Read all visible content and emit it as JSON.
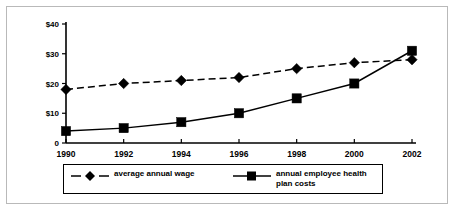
{
  "chart_data": {
    "type": "line",
    "title": "",
    "subtitle": "",
    "xlabel": "",
    "ylabel": "",
    "categories": [
      "1990",
      "1992",
      "1994",
      "1996",
      "1998",
      "2000",
      "2002"
    ],
    "x": [
      1990,
      1992,
      1994,
      1996,
      1998,
      2000,
      2002
    ],
    "xlim": [
      1990,
      2002
    ],
    "ylim": [
      0,
      40
    ],
    "y_ticks": [
      0,
      10,
      20,
      30,
      40
    ],
    "y_tick_labels": [
      "0",
      "$10",
      "$20",
      "$30",
      "$40"
    ],
    "x_tick_labels": [
      "1990",
      "1992",
      "1994",
      "1996",
      "1998",
      "2000",
      "2002"
    ],
    "grid": false,
    "legend_position": "bottom",
    "series": [
      {
        "name": "average annual wage",
        "values": [
          18,
          20,
          21,
          22,
          25,
          27,
          28
        ],
        "line_style": "dashed",
        "marker": "diamond",
        "color": "#000000"
      },
      {
        "name": "annual employee health plan costs",
        "values": [
          4,
          5,
          7,
          10,
          15,
          20,
          31
        ],
        "line_style": "solid",
        "marker": "square",
        "color": "#000000"
      }
    ]
  },
  "legend": {
    "entries": [
      {
        "label": "average annual wage",
        "marker": "diamond-marker",
        "line_style": "dashed"
      },
      {
        "label": "annual employee health plan costs",
        "marker": "square-marker",
        "line_style": "solid"
      }
    ]
  },
  "colors": {
    "background": "#ffffff",
    "foreground": "#000000",
    "frame": "#b9b9b9"
  }
}
